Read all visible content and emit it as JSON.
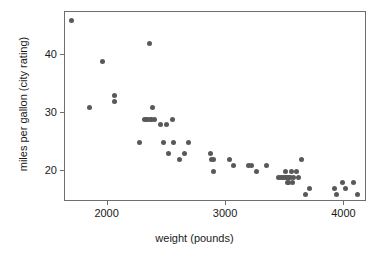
{
  "chart_data": {
    "type": "scatter",
    "title": "",
    "xlabel": "weight (pounds)",
    "ylabel": "miles per gallon (city rating)",
    "xlim": [
      1640,
      4190
    ],
    "ylim": [
      14.7,
      47.5
    ],
    "xticks": [
      2000,
      3000,
      4000
    ],
    "xtick_labels": [
      "2000",
      "3000",
      "4000"
    ],
    "yticks": [
      20,
      30,
      40
    ],
    "ytick_labels": [
      "20",
      "30",
      "40"
    ],
    "grid": false,
    "legend": null,
    "marker": {
      "shape": "circle",
      "color": "#595959",
      "size_px": 5
    },
    "series": [
      {
        "name": "cars",
        "x": [
          1695,
          1845,
          1955,
          2055,
          2055,
          2270,
          2310,
          2325,
          2340,
          2355,
          2365,
          2370,
          2380,
          2395,
          2450,
          2470,
          2500,
          2510,
          2545,
          2560,
          2605,
          2650,
          2680,
          2870,
          2880,
          2890,
          2895,
          3030,
          3060,
          3190,
          3215,
          3255,
          3340,
          3440,
          3460,
          3480,
          3495,
          3505,
          3510,
          3515,
          3520,
          3525,
          3530,
          3540,
          3555,
          3560,
          3570,
          3595,
          3610,
          3640,
          3670,
          3705,
          3915,
          3930,
          3985,
          4005,
          4080,
          4110
        ],
        "y": [
          46,
          31,
          39,
          33,
          32,
          25,
          29,
          29,
          29,
          42,
          29,
          29,
          31,
          29,
          28,
          25,
          28,
          23,
          29,
          25,
          22,
          23,
          25,
          23,
          22,
          22,
          20,
          22,
          21,
          21,
          21,
          20,
          21,
          19,
          19,
          19,
          19,
          20,
          19,
          19,
          18,
          19,
          18,
          19,
          20,
          18,
          19,
          20,
          19,
          22,
          16,
          17,
          17,
          16,
          18,
          17,
          18,
          16
        ]
      }
    ]
  },
  "axes": {
    "ylabel_text": "miles per gallon (city rating)",
    "xlabel_text": "weight (pounds)"
  }
}
